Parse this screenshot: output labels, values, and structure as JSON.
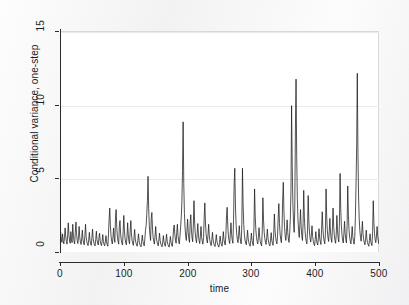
{
  "figure": {
    "background_color": "#f2f2f2",
    "panel_color": "#ffffff",
    "line_color": "#1a1a1a",
    "grid_color": "#e9e9ef"
  },
  "chart_data": {
    "type": "line",
    "title": "",
    "subtitle": "",
    "xlabel": "time",
    "ylabel": "Conditional variance, one-step",
    "xlim": [
      0,
      500
    ],
    "ylim": [
      0,
      15
    ],
    "xticks": [
      0,
      100,
      200,
      300,
      400,
      500
    ],
    "yticks": [
      0,
      5,
      10,
      15
    ],
    "xtick_labels": [
      "0",
      "100",
      "200",
      "300",
      "400",
      "500"
    ],
    "ytick_labels": [
      "0",
      "5",
      "10",
      "15"
    ],
    "grid": "horizontal-only",
    "legend": "none",
    "annotations": [],
    "series": [
      {
        "name": "Conditional variance, one-step",
        "color": "#1a1a1a",
        "x_start": 1,
        "x_step": 1,
        "n_points": 497,
        "values": [
          1.45,
          0.95,
          0.72,
          1.3,
          0.85,
          0.62,
          1.05,
          1.7,
          1.1,
          0.78,
          0.6,
          1.25,
          2.05,
          1.2,
          0.82,
          0.66,
          1.45,
          0.9,
          0.7,
          1.95,
          1.15,
          0.8,
          0.62,
          1.4,
          2.1,
          1.25,
          0.85,
          0.64,
          1.1,
          1.8,
          1.05,
          0.75,
          0.58,
          0.95,
          1.55,
          0.92,
          0.68,
          0.55,
          1.2,
          1.95,
          1.1,
          0.78,
          0.6,
          0.5,
          0.88,
          1.4,
          0.86,
          0.62,
          0.52,
          1.05,
          1.62,
          0.98,
          0.7,
          0.56,
          0.48,
          0.92,
          1.48,
          0.9,
          0.66,
          0.54,
          1.0,
          1.35,
          0.84,
          0.62,
          0.5,
          0.8,
          1.25,
          0.8,
          0.58,
          0.48,
          0.75,
          1.18,
          0.76,
          0.56,
          0.46,
          1.3,
          2.3,
          3.05,
          1.85,
          1.15,
          0.8,
          0.62,
          1.05,
          1.7,
          1.0,
          0.72,
          2.45,
          2.95,
          1.75,
          1.1,
          0.78,
          0.6,
          1.8,
          2.2,
          1.3,
          0.88,
          0.66,
          0.54,
          1.45,
          2.55,
          1.5,
          0.95,
          0.7,
          0.56,
          1.1,
          2.05,
          1.22,
          0.82,
          0.62,
          1.5,
          2.2,
          1.3,
          0.86,
          0.64,
          0.52,
          1.02,
          1.6,
          0.96,
          0.7,
          0.56,
          0.46,
          0.85,
          1.3,
          0.82,
          0.6,
          0.5,
          0.42,
          0.78,
          1.22,
          0.78,
          0.58,
          0.48,
          0.95,
          1.55,
          1.85,
          2.6,
          3.55,
          5.2,
          3.0,
          1.85,
          1.2,
          0.85,
          2.35,
          2.75,
          1.62,
          1.05,
          0.76,
          0.6,
          1.15,
          1.8,
          1.08,
          0.76,
          0.6,
          0.48,
          0.88,
          1.35,
          0.84,
          0.62,
          0.5,
          0.42,
          0.76,
          1.18,
          0.76,
          0.56,
          0.46,
          0.82,
          1.28,
          0.8,
          0.6,
          0.48,
          0.4,
          0.72,
          1.12,
          0.74,
          0.55,
          0.45,
          0.95,
          1.62,
          1.9,
          1.25,
          0.88,
          0.66,
          1.4,
          1.95,
          1.18,
          0.82,
          0.62,
          1.1,
          1.7,
          2.4,
          3.4,
          5.6,
          8.9,
          4.7,
          2.7,
          1.7,
          1.15,
          0.85,
          1.55,
          2.3,
          1.4,
          0.95,
          0.72,
          2.0,
          2.6,
          1.55,
          1.02,
          0.76,
          1.9,
          3.55,
          2.1,
          1.35,
          0.92,
          0.7,
          1.3,
          2.0,
          1.22,
          0.84,
          0.64,
          1.15,
          1.8,
          1.1,
          0.78,
          0.6,
          1.05,
          2.45,
          3.4,
          2.05,
          1.3,
          0.9,
          0.68,
          1.25,
          1.95,
          1.18,
          0.82,
          0.62,
          0.5,
          0.9,
          1.4,
          0.88,
          0.64,
          0.52,
          0.44,
          0.8,
          1.25,
          0.8,
          0.58,
          0.48,
          0.4,
          0.72,
          1.15,
          0.75,
          0.56,
          0.46,
          0.88,
          1.45,
          0.9,
          0.66,
          0.54,
          1.2,
          2.55,
          3.1,
          1.85,
          1.18,
          0.82,
          0.64,
          1.35,
          2.05,
          1.25,
          0.86,
          0.66,
          2.2,
          4.8,
          5.75,
          3.2,
          1.95,
          1.28,
          0.9,
          0.7,
          1.2,
          1.85,
          1.12,
          0.8,
          0.62,
          1.95,
          5.75,
          3.25,
          1.95,
          1.25,
          0.88,
          0.68,
          0.56,
          1.0,
          1.55,
          0.95,
          0.7,
          0.56,
          0.46,
          0.85,
          1.35,
          0.85,
          0.62,
          0.5,
          1.75,
          4.35,
          2.5,
          1.55,
          1.05,
          0.78,
          0.62,
          1.1,
          1.72,
          1.05,
          0.76,
          0.6,
          0.48,
          1.5,
          3.75,
          2.25,
          1.42,
          0.98,
          0.74,
          0.58,
          1.05,
          1.62,
          1.0,
          0.74,
          0.58,
          0.48,
          0.88,
          1.38,
          0.86,
          0.64,
          0.52,
          1.3,
          2.65,
          1.6,
          1.05,
          0.78,
          0.62,
          1.2,
          2.4,
          3.35,
          2.0,
          1.28,
          0.9,
          0.7,
          1.6,
          3.6,
          4.8,
          2.75,
          1.72,
          1.15,
          0.85,
          1.45,
          2.25,
          1.38,
          0.95,
          0.72,
          1.35,
          2.3,
          4.2,
          10.0,
          6.0,
          3.4,
          2.1,
          1.4,
          3.0,
          8.4,
          11.8,
          6.6,
          3.7,
          2.25,
          1.5,
          1.05,
          1.95,
          2.95,
          1.78,
          1.18,
          0.85,
          2.0,
          4.25,
          2.45,
          1.55,
          1.05,
          0.78,
          0.62,
          1.55,
          3.9,
          2.25,
          1.42,
          0.98,
          0.74,
          1.2,
          1.85,
          1.12,
          0.8,
          0.62,
          0.5,
          0.92,
          1.45,
          0.9,
          0.66,
          0.54,
          1.05,
          1.65,
          1.02,
          0.74,
          0.58,
          1.6,
          2.8,
          1.7,
          1.1,
          0.8,
          0.62,
          1.35,
          4.35,
          2.5,
          1.55,
          1.05,
          0.78,
          1.45,
          2.35,
          1.42,
          0.95,
          0.72,
          1.7,
          3.05,
          1.82,
          1.18,
          0.85,
          0.66,
          1.3,
          2.55,
          1.52,
          1.0,
          0.75,
          2.1,
          5.4,
          3.05,
          1.85,
          1.2,
          0.88,
          0.68,
          1.35,
          2.15,
          1.3,
          0.9,
          0.68,
          1.85,
          4.55,
          2.6,
          1.6,
          1.08,
          0.8,
          0.62,
          1.15,
          1.8,
          1.1,
          0.78,
          0.6,
          1.1,
          2.4,
          4.6,
          7.2,
          12.2,
          6.8,
          3.8,
          2.3,
          1.5,
          1.05,
          0.8,
          1.4,
          2.15,
          1.3,
          0.9,
          0.7,
          0.56,
          1.0,
          1.55,
          0.95,
          0.7,
          0.56,
          0.46,
          0.85,
          1.3,
          0.82,
          0.6,
          0.5,
          1.45,
          3.55,
          2.05,
          1.3,
          0.9,
          0.7,
          1.15,
          1.8,
          1.1,
          0.8,
          0.62,
          1.25,
          2.4,
          1.45,
          1.0,
          0.78,
          1.55,
          1.62
        ]
      }
    ]
  }
}
